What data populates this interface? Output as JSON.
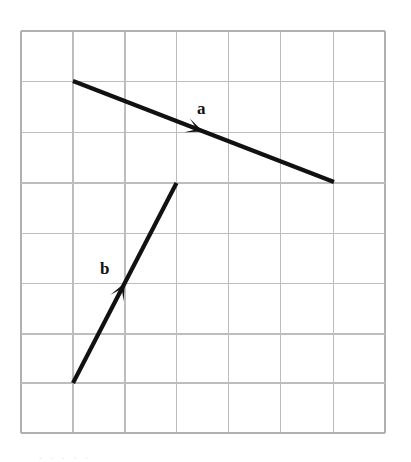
{
  "figure": {
    "background_color": "#ffffff",
    "width": 411,
    "height": 462
  },
  "grid": {
    "color": "#bdbdbd",
    "border_color": "#b0b0b0",
    "line_width": 1.6,
    "x_left": 21,
    "y_top": 31,
    "cell_width": 52,
    "cell_height": 50.25,
    "columns": 7,
    "rows": 8,
    "x_lines": [
      21,
      73,
      125,
      176.5,
      228.5,
      280.5,
      333.5,
      385
    ],
    "y_lines": [
      31,
      81.3,
      132.5,
      183,
      233.3,
      283.5,
      333.8,
      383,
      433.3
    ]
  },
  "vectors": [
    {
      "name": "a",
      "label": "a",
      "color": "#111111",
      "stroke_width": 4.2,
      "start_px": [
        73,
        81
      ],
      "end_px": [
        334,
        182
      ],
      "start_grid": [
        1,
        1
      ],
      "end_grid": [
        6,
        3
      ],
      "components_cells": [
        5,
        2
      ],
      "arrowhead_px": [
        203,
        131.5
      ],
      "arrowhead_position": "midpoint",
      "label_px": [
        197,
        100
      ]
    },
    {
      "name": "b",
      "label": "b",
      "color": "#111111",
      "stroke_width": 4.2,
      "start_px": [
        73,
        383
      ],
      "end_px": [
        176.5,
        183
      ],
      "start_grid": [
        1,
        7
      ],
      "end_grid": [
        3,
        3
      ],
      "components_cells": [
        2,
        -4
      ],
      "arrowhead_px": [
        124.8,
        283
      ],
      "arrowhead_position": "midpoint",
      "label_px": [
        100,
        260
      ]
    }
  ],
  "footer_ghost": {
    "text": "· ·   ·        ·        ·"
  },
  "chart_data": {
    "type": "scatter",
    "xlabel": "",
    "ylabel": "",
    "xlim": [
      0,
      7
    ],
    "ylim": [
      0,
      8
    ],
    "grid": true,
    "legend": "none",
    "annotations": [
      {
        "text": "a",
        "x": 3.5,
        "y": 6.4
      },
      {
        "text": "b",
        "x": 1.65,
        "y": 3.35
      }
    ],
    "series": [
      {
        "name": "a",
        "type": "vector",
        "x": [
          1,
          6
        ],
        "y": [
          7,
          5
        ],
        "dx": 5,
        "dy": -2
      },
      {
        "name": "b",
        "type": "vector",
        "x": [
          1,
          3
        ],
        "y": [
          1,
          5
        ],
        "dx": 2,
        "dy": 4
      }
    ]
  }
}
